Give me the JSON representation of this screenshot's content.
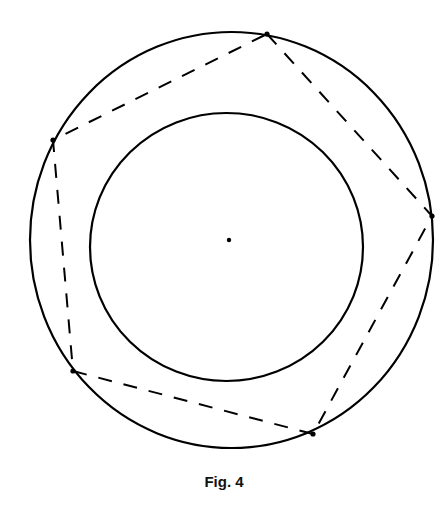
{
  "figure": {
    "caption": "Fig. 4",
    "stroke_color": "#000000",
    "outer_circle": {
      "cx": 231.5,
      "cy": 240,
      "rx": 201.5,
      "ry": 208
    },
    "inner_circle": {
      "cx": 226.5,
      "cy": 247,
      "rx": 136.5,
      "ry": 134
    },
    "center_point": {
      "x": 229,
      "y": 240
    },
    "pentagon_vertices": [
      {
        "x": 267,
        "y": 34
      },
      {
        "x": 432,
        "y": 216
      },
      {
        "x": 313,
        "y": 434
      },
      {
        "x": 73,
        "y": 371
      },
      {
        "x": 53,
        "y": 140
      }
    ],
    "dash_pattern": "14 12"
  }
}
